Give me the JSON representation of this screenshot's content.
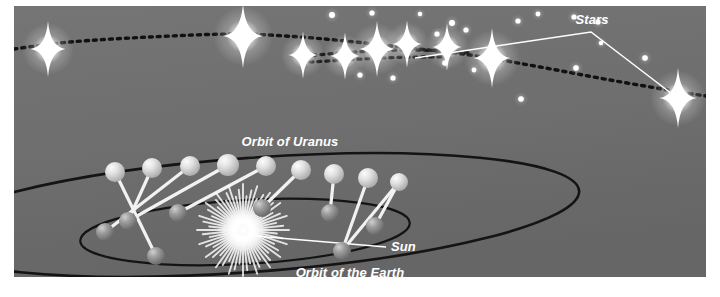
{
  "figure": {
    "type": "astronomy-diagram",
    "title_text": "",
    "background_color": "#6f6f6f",
    "frame_color": "#ffffff",
    "width": 720,
    "height": 297
  },
  "labels": {
    "stars": "Stars",
    "orbit_of_uranus": "Orbit of Uranus",
    "orbit_of_the_earth": "Orbit of the Earth",
    "sun": "Sun"
  },
  "colors": {
    "sky": "#6f6f6f",
    "sky_dark": "#676767",
    "orbit_line": "#141414",
    "sight_line": "#f2f2f2",
    "leader_line": "#ffffff",
    "star_glow": "#ffffff",
    "uranus_body": "#d8d8d8",
    "uranus_highlight": "#f4f4f4",
    "earth_body": "#8e8e8e",
    "earth_highlight": "#c9c9c9",
    "sun_core": "#ffffff",
    "dotted_track": "#111111",
    "label_text": "#ffffff"
  },
  "chart_data": {
    "type": "scatter",
    "xlabel": "",
    "ylabel": "",
    "grid": false,
    "legend": "none",
    "sky_panel": {
      "x": 14,
      "y": 6,
      "width": 692,
      "height": 271
    },
    "dotted_tracks": [
      {
        "name": "track-lower",
        "dash": "3 5",
        "width": 3.4,
        "points": [
          [
            14,
            49
          ],
          [
            70,
            42
          ],
          [
            150,
            37
          ],
          [
            235,
            34
          ],
          [
            300,
            37
          ],
          [
            355,
            42
          ],
          [
            400,
            47
          ],
          [
            470,
            55
          ],
          [
            540,
            67
          ],
          [
            610,
            80
          ],
          [
            680,
            92
          ],
          [
            706,
            96
          ]
        ]
      },
      {
        "name": "track-middle",
        "dash": "3 5",
        "width": 3.2,
        "points": [
          [
            305,
            56
          ],
          [
            340,
            53
          ],
          [
            375,
            51
          ],
          [
            410,
            50
          ],
          [
            445,
            51
          ],
          [
            470,
            53
          ]
        ]
      },
      {
        "name": "track-upper",
        "dash": "3 5",
        "width": 3.2,
        "points": [
          [
            310,
            62
          ],
          [
            345,
            60
          ],
          [
            380,
            58
          ],
          [
            415,
            57
          ],
          [
            448,
            57
          ]
        ]
      }
    ],
    "bright_stars": [
      {
        "x": 48,
        "y": 49,
        "r": 13
      },
      {
        "x": 243,
        "y": 36,
        "r": 15
      },
      {
        "x": 303,
        "y": 55,
        "r": 11
      },
      {
        "x": 345,
        "y": 56,
        "r": 11
      },
      {
        "x": 377,
        "y": 49,
        "r": 13
      },
      {
        "x": 407,
        "y": 44,
        "r": 11
      },
      {
        "x": 447,
        "y": 47,
        "r": 11
      },
      {
        "x": 492,
        "y": 58,
        "r": 14
      },
      {
        "x": 678,
        "y": 98,
        "r": 14
      }
    ],
    "faint_stars": [
      {
        "x": 332,
        "y": 15,
        "r": 3.0
      },
      {
        "x": 372,
        "y": 13,
        "r": 2.6
      },
      {
        "x": 420,
        "y": 14,
        "r": 2.2
      },
      {
        "x": 452,
        "y": 23,
        "r": 3.0
      },
      {
        "x": 360,
        "y": 75,
        "r": 2.6
      },
      {
        "x": 393,
        "y": 78,
        "r": 2.6
      },
      {
        "x": 445,
        "y": 63,
        "r": 2.8
      },
      {
        "x": 474,
        "y": 70,
        "r": 2.4
      },
      {
        "x": 437,
        "y": 34,
        "r": 2.6
      },
      {
        "x": 466,
        "y": 30,
        "r": 2.6
      },
      {
        "x": 518,
        "y": 21,
        "r": 2.6
      },
      {
        "x": 538,
        "y": 14,
        "r": 2.4
      },
      {
        "x": 574,
        "y": 17,
        "r": 2.6
      },
      {
        "x": 598,
        "y": 22,
        "r": 2.6
      },
      {
        "x": 576,
        "y": 68,
        "r": 2.8
      },
      {
        "x": 645,
        "y": 58,
        "r": 2.8
      },
      {
        "x": 521,
        "y": 99,
        "r": 2.8
      },
      {
        "x": 601,
        "y": 43,
        "r": 2.2
      }
    ],
    "stars_leader": {
      "from": [
        415,
        58
      ],
      "vertex": [
        591,
        32
      ],
      "to": [
        676,
        97
      ]
    },
    "uranus_orbit": {
      "cx": 250,
      "cy": 215,
      "rx": 330,
      "ry": 57,
      "rotation": -4.2
    },
    "earth_orbit": {
      "cx": 245,
      "cy": 232,
      "rx": 165,
      "ry": 32,
      "rotation": -3.2
    },
    "uranus_positions": [
      {
        "x": 115,
        "y": 172,
        "r": 10
      },
      {
        "x": 152,
        "y": 168,
        "r": 10
      },
      {
        "x": 190,
        "y": 166,
        "r": 10
      },
      {
        "x": 228,
        "y": 165,
        "r": 11
      },
      {
        "x": 266,
        "y": 166,
        "r": 10
      },
      {
        "x": 301,
        "y": 170,
        "r": 10
      },
      {
        "x": 334,
        "y": 174,
        "r": 10
      },
      {
        "x": 368,
        "y": 178,
        "r": 10
      },
      {
        "x": 399,
        "y": 182,
        "r": 9
      }
    ],
    "earth_positions": [
      {
        "x": 105,
        "y": 232,
        "r": 9
      },
      {
        "x": 128,
        "y": 221,
        "r": 9
      },
      {
        "x": 178,
        "y": 213,
        "r": 9
      },
      {
        "x": 262,
        "y": 208,
        "r": 9
      },
      {
        "x": 330,
        "y": 213,
        "r": 9
      },
      {
        "x": 375,
        "y": 226,
        "r": 9
      },
      {
        "x": 342,
        "y": 251,
        "r": 9
      },
      {
        "x": 156,
        "y": 256,
        "r": 9
      }
    ],
    "sight_lines": [
      {
        "from": [
          115,
          172
        ],
        "to": [
          156,
          256
        ]
      },
      {
        "from": [
          152,
          168
        ],
        "to": [
          128,
          221
        ]
      },
      {
        "from": [
          190,
          166
        ],
        "to": [
          105,
          232
        ]
      },
      {
        "from": [
          228,
          165
        ],
        "to": [
          128,
          221
        ]
      },
      {
        "from": [
          266,
          166
        ],
        "to": [
          178,
          213
        ]
      },
      {
        "from": [
          301,
          170
        ],
        "to": [
          262,
          208
        ]
      },
      {
        "from": [
          334,
          174
        ],
        "to": [
          330,
          213
        ]
      },
      {
        "from": [
          368,
          178
        ],
        "to": [
          342,
          251
        ]
      },
      {
        "from": [
          399,
          182
        ],
        "to": [
          375,
          226
        ]
      },
      {
        "from": [
          399,
          182
        ],
        "to": [
          342,
          251
        ]
      }
    ],
    "sun": {
      "x": 243,
      "y": 230,
      "outer_radius": 46,
      "core_radius": 13,
      "ray_count": 60
    },
    "sun_leader": {
      "from": [
        255,
        236
      ],
      "to": [
        386,
        247
      ]
    },
    "label_positions": {
      "stars": {
        "x": 592,
        "y": 24
      },
      "orbit_of_uranus": {
        "x": 290,
        "y": 146
      },
      "orbit_of_the_earth": {
        "x": 350,
        "y": 277
      },
      "sun": {
        "x": 391,
        "y": 251
      }
    }
  }
}
